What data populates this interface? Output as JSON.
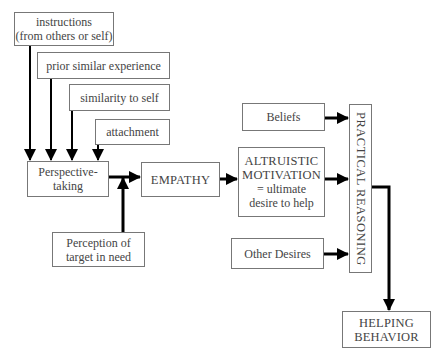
{
  "nodes": {
    "instructions": {
      "line1": "instructions",
      "line2": "(from others or self)"
    },
    "prior_experience": {
      "label": "prior similar experience"
    },
    "similarity": {
      "label": "similarity to self"
    },
    "attachment": {
      "label": "attachment"
    },
    "perspective_taking": {
      "line1": "Perspective-",
      "line2": "taking"
    },
    "perception": {
      "line1": "Perception of",
      "line2": "target in need"
    },
    "empathy": {
      "label": "EMPATHY"
    },
    "beliefs": {
      "label": "Beliefs"
    },
    "altruistic": {
      "line1": "ALTRUISTIC",
      "line2": "MOTIVATION",
      "line3": "= ultimate",
      "line4": "desire to help"
    },
    "other_desires": {
      "label": "Other Desires"
    },
    "practical_reasoning": {
      "label": "PRACTICAL REASONING"
    },
    "helping_behavior": {
      "line1": "HELPING",
      "line2": "BEHAVIOR"
    }
  },
  "edges": [
    {
      "from": "instructions",
      "to": "perspective_taking"
    },
    {
      "from": "prior_experience",
      "to": "perspective_taking"
    },
    {
      "from": "similarity",
      "to": "perspective_taking"
    },
    {
      "from": "attachment",
      "to": "perspective_taking"
    },
    {
      "from": "perspective_taking",
      "to": "empathy"
    },
    {
      "from": "perception",
      "to": "empathy"
    },
    {
      "from": "empathy",
      "to": "altruistic"
    },
    {
      "from": "beliefs",
      "to": "practical_reasoning"
    },
    {
      "from": "altruistic",
      "to": "practical_reasoning"
    },
    {
      "from": "other_desires",
      "to": "practical_reasoning"
    },
    {
      "from": "practical_reasoning",
      "to": "helping_behavior"
    }
  ]
}
